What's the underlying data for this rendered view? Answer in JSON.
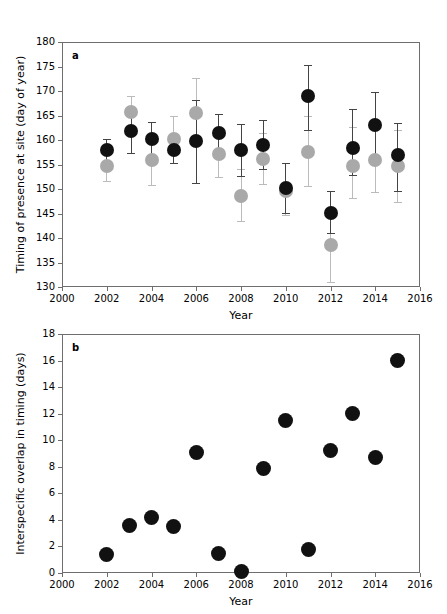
{
  "figure": {
    "width": 447,
    "height": 614,
    "background": "#ffffff"
  },
  "colors": {
    "black_marker": "#111111",
    "gray_marker": "#a9a9a9",
    "black_errorbar": "#444444",
    "gray_errorbar": "#bbbbbb",
    "axis": "#6e6e6e"
  },
  "panel_a": {
    "letter": "a",
    "plot_box": {
      "left": 62,
      "top": 42,
      "right": 420,
      "bottom": 287
    },
    "chart_data": {
      "type": "scatter",
      "title": "",
      "xlabel": "Year",
      "ylabel": "Timing of presence at site (day of year)",
      "xlim": [
        2000,
        2016
      ],
      "ylim": [
        130,
        180
      ],
      "xticks": [
        2000,
        2002,
        2004,
        2006,
        2008,
        2010,
        2012,
        2014,
        2016
      ],
      "yticks": [
        130,
        135,
        140,
        145,
        150,
        155,
        160,
        165,
        170,
        175,
        180
      ],
      "grid": false,
      "legend": "none",
      "series": [
        {
          "name": "species-black",
          "color": "#111111",
          "points": [
            {
              "x": 2002.0,
              "y": 158.0,
              "lo": 155.8,
              "hi": 160.2
            },
            {
              "x": 2003.1,
              "y": 161.8,
              "lo": 157.4,
              "hi": 165.8
            },
            {
              "x": 2004.0,
              "y": 160.2,
              "lo": 157.0,
              "hi": 163.6
            },
            {
              "x": 2005.0,
              "y": 158.0,
              "lo": 155.4,
              "hi": 160.6
            },
            {
              "x": 2006.0,
              "y": 159.8,
              "lo": 151.2,
              "hi": 168.2
            },
            {
              "x": 2007.0,
              "y": 161.5,
              "lo": 157.8,
              "hi": 165.4
            },
            {
              "x": 2008.0,
              "y": 158.0,
              "lo": 152.6,
              "hi": 163.2
            },
            {
              "x": 2009.0,
              "y": 159.0,
              "lo": 154.0,
              "hi": 164.0
            },
            {
              "x": 2010.0,
              "y": 150.2,
              "lo": 145.2,
              "hi": 155.4
            },
            {
              "x": 2011.0,
              "y": 169.0,
              "lo": 162.0,
              "hi": 175.4
            },
            {
              "x": 2012.0,
              "y": 145.2,
              "lo": 141.0,
              "hi": 149.6
            },
            {
              "x": 2013.0,
              "y": 158.4,
              "lo": 152.8,
              "hi": 166.4
            },
            {
              "x": 2014.0,
              "y": 163.0,
              "lo": 155.4,
              "hi": 169.8
            },
            {
              "x": 2015.0,
              "y": 157.0,
              "lo": 149.6,
              "hi": 163.4
            }
          ]
        },
        {
          "name": "species-gray",
          "color": "#a9a9a9",
          "points": [
            {
              "x": 2002.0,
              "y": 154.6,
              "lo": 151.6,
              "hi": 157.6
            },
            {
              "x": 2003.1,
              "y": 165.8,
              "lo": 161.8,
              "hi": 169.0
            },
            {
              "x": 2004.0,
              "y": 155.9,
              "lo": 150.8,
              "hi": 160.8
            },
            {
              "x": 2005.0,
              "y": 160.2,
              "lo": 155.4,
              "hi": 165.0
            },
            {
              "x": 2006.0,
              "y": 165.6,
              "lo": 159.6,
              "hi": 172.6
            },
            {
              "x": 2007.0,
              "y": 157.2,
              "lo": 152.4,
              "hi": 162.0
            },
            {
              "x": 2008.0,
              "y": 148.6,
              "lo": 143.4,
              "hi": 154.0
            },
            {
              "x": 2009.0,
              "y": 156.2,
              "lo": 151.0,
              "hi": 161.4
            },
            {
              "x": 2010.0,
              "y": 149.6,
              "lo": 144.6,
              "hi": 155.4
            },
            {
              "x": 2011.0,
              "y": 157.6,
              "lo": 150.6,
              "hi": 164.8
            },
            {
              "x": 2012.0,
              "y": 138.6,
              "lo": 131.0,
              "hi": 145.6
            },
            {
              "x": 2013.0,
              "y": 154.6,
              "lo": 148.2,
              "hi": 162.6
            },
            {
              "x": 2014.0,
              "y": 156.0,
              "lo": 149.4,
              "hi": 163.4
            },
            {
              "x": 2015.0,
              "y": 154.6,
              "lo": 147.4,
              "hi": 162.0
            }
          ]
        }
      ]
    }
  },
  "panel_b": {
    "letter": "b",
    "plot_box": {
      "left": 62,
      "top": 334,
      "right": 420,
      "bottom": 573
    },
    "chart_data": {
      "type": "scatter",
      "title": "",
      "xlabel": "Year",
      "ylabel": "Interspecific overlap in timing (days)",
      "xlim": [
        2000,
        2016
      ],
      "ylim": [
        0,
        18
      ],
      "xticks": [
        2000,
        2002,
        2004,
        2006,
        2008,
        2010,
        2012,
        2014,
        2016
      ],
      "yticks": [
        0,
        2,
        4,
        6,
        8,
        10,
        12,
        14,
        16,
        18
      ],
      "grid": false,
      "legend": "none",
      "series": [
        {
          "name": "overlap",
          "color": "#111111",
          "x": [
            2002,
            2003,
            2004,
            2005,
            2006,
            2007,
            2008,
            2009,
            2010,
            2011,
            2012,
            2013,
            2014,
            2015
          ],
          "values": [
            1.4,
            3.6,
            4.2,
            3.5,
            9.1,
            1.5,
            0.1,
            7.9,
            11.5,
            1.8,
            9.2,
            12.0,
            8.7,
            16.0
          ]
        }
      ]
    }
  }
}
